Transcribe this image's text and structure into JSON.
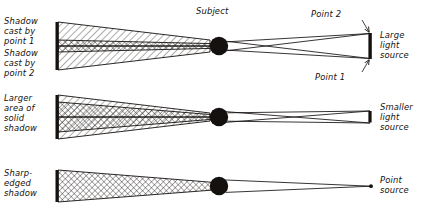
{
  "figure": {
    "title": "",
    "subject_label": "Subject",
    "background_color": "#ffffff",
    "ink_color": "#14110f"
  },
  "rows": [
    {
      "id": "large-source",
      "left_labels": [
        {
          "id": "shadow-point-1",
          "lines": [
            "Shadow",
            "cast by",
            "point 1"
          ]
        },
        {
          "id": "shadow-point-2",
          "lines": [
            "Shadow",
            "cast by",
            "point 2"
          ]
        }
      ],
      "right_label": {
        "id": "large-light-source",
        "lines": [
          "Large",
          "light",
          "source"
        ]
      },
      "point_labels": [
        {
          "id": "point-2",
          "text": "Point 2"
        },
        {
          "id": "point-1",
          "text": "Point 1"
        }
      ],
      "source_type": "bar",
      "source_height_px": 26
    },
    {
      "id": "smaller-source",
      "left_labels": [
        {
          "id": "larger-solid-shadow",
          "lines": [
            "Larger",
            "area of",
            "solid",
            "shadow"
          ]
        }
      ],
      "right_label": {
        "id": "smaller-light-source",
        "lines": [
          "Smaller",
          "light",
          "source"
        ]
      },
      "point_labels": [],
      "source_type": "bar",
      "source_height_px": 11
    },
    {
      "id": "point-source",
      "left_labels": [
        {
          "id": "sharp-edged-shadow",
          "lines": [
            "Sharp-",
            "edged",
            "shadow"
          ]
        }
      ],
      "right_label": {
        "id": "point-source-label",
        "lines": [
          "Point",
          "source"
        ]
      },
      "point_labels": [],
      "source_type": "dot",
      "source_height_px": 3
    }
  ],
  "legend": {
    "umbra_pattern": "crosshatch",
    "penumbra_pattern": "diagonal-hatch"
  }
}
